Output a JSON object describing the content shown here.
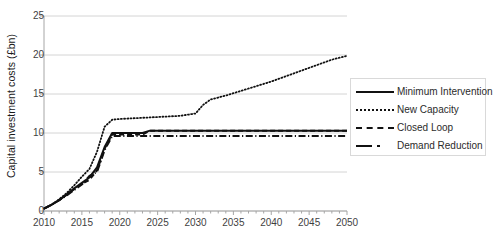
{
  "chart_data": {
    "type": "line",
    "title": "",
    "xlabel": "",
    "ylabel": "Capital investment costs (£bn)",
    "xlim": [
      2010,
      2050
    ],
    "ylim": [
      0,
      25
    ],
    "ytick_labels": [
      "0",
      "5",
      "10",
      "15",
      "20",
      "25"
    ],
    "ytick_values": [
      0,
      5,
      10,
      15,
      20,
      25
    ],
    "xtick_labels": [
      "2010",
      "2015",
      "2020",
      "2025",
      "2030",
      "2035",
      "2040",
      "2045",
      "2050"
    ],
    "xtick_values": [
      2010,
      2015,
      2020,
      2025,
      2030,
      2035,
      2040,
      2045,
      2050
    ],
    "xminor_step": 1,
    "grid": "horizontal",
    "legend_position": "right",
    "series": [
      {
        "name": "Minimum Intervention",
        "style": "solid",
        "color": "#111111",
        "x": [
          2010,
          2011,
          2012,
          2013,
          2014,
          2015,
          2016,
          2017,
          2018,
          2019,
          2020,
          2021,
          2022,
          2023,
          2024,
          2025,
          2030,
          2035,
          2040,
          2045,
          2050
        ],
        "values": [
          0.3,
          0.8,
          1.4,
          2.1,
          2.9,
          3.6,
          4.3,
          5.6,
          8.2,
          10.0,
          10.0,
          10.0,
          10.0,
          10.0,
          10.3,
          10.3,
          10.3,
          10.3,
          10.3,
          10.3,
          10.3
        ]
      },
      {
        "name": "New Capacity",
        "style": "dotted",
        "color": "#111111",
        "x": [
          2010,
          2011,
          2012,
          2013,
          2014,
          2015,
          2016,
          2017,
          2018,
          2019,
          2020,
          2022,
          2024,
          2026,
          2028,
          2030,
          2031,
          2032,
          2034,
          2036,
          2038,
          2040,
          2042,
          2044,
          2046,
          2048,
          2050
        ],
        "values": [
          0.3,
          0.8,
          1.5,
          2.3,
          3.3,
          4.4,
          5.4,
          7.6,
          10.8,
          11.7,
          11.8,
          11.9,
          12.0,
          12.1,
          12.2,
          12.5,
          13.6,
          14.3,
          14.8,
          15.4,
          16.0,
          16.6,
          17.3,
          18.0,
          18.7,
          19.4,
          19.9
        ]
      },
      {
        "name": "Closed Loop",
        "style": "dashed",
        "color": "#111111",
        "x": [
          2010,
          2011,
          2012,
          2013,
          2014,
          2015,
          2016,
          2017,
          2018,
          2019,
          2020,
          2022,
          2023,
          2024,
          2025,
          2030,
          2035,
          2040,
          2045,
          2050
        ],
        "values": [
          0.3,
          0.8,
          1.4,
          2.1,
          2.8,
          3.5,
          4.0,
          5.2,
          8.0,
          9.8,
          9.8,
          9.8,
          9.8,
          10.3,
          10.3,
          10.3,
          10.3,
          10.3,
          10.3,
          10.3
        ]
      },
      {
        "name": "Demand Reduction",
        "style": "dashdot",
        "color": "#111111",
        "x": [
          2010,
          2011,
          2012,
          2013,
          2014,
          2015,
          2016,
          2017,
          2018,
          2019,
          2020,
          2022,
          2024,
          2026,
          2030,
          2035,
          2040,
          2045,
          2050
        ],
        "values": [
          0.3,
          0.8,
          1.4,
          2.0,
          2.7,
          3.4,
          4.5,
          5.0,
          7.8,
          9.6,
          9.6,
          9.6,
          9.6,
          9.6,
          9.6,
          9.6,
          9.6,
          9.6,
          9.6
        ]
      }
    ]
  },
  "legend": {
    "items": [
      {
        "label": "Minimum Intervention",
        "style": "solid"
      },
      {
        "label": "New Capacity",
        "style": "dotted"
      },
      {
        "label": "Closed Loop",
        "style": "dashed"
      },
      {
        "label": "Demand Reduction",
        "style": "dashdot"
      }
    ]
  },
  "colors": {
    "line": "#111111",
    "grid": "#d4d4d4",
    "axis": "#a6a6a6",
    "text": "#3f3f3f",
    "legend_border": "#d9d9d9"
  }
}
